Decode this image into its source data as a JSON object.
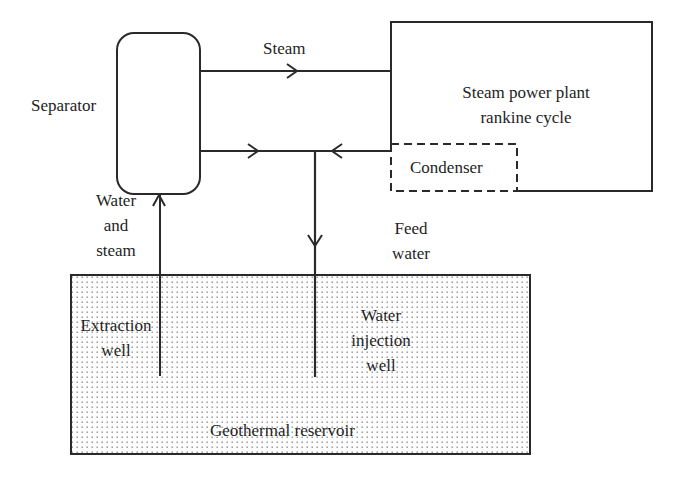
{
  "diagram": {
    "title": "",
    "colors": {
      "stroke": "#2a2a2a",
      "text": "#1e1e1e",
      "reservoir_dot": "#8a8a8a",
      "background": "#ffffff"
    },
    "nodes": {
      "separator": {
        "label": "Separator",
        "shape": "rounded-rectangle"
      },
      "power_plant": {
        "label_line1": "Steam power plant",
        "label_line2": "rankine cycle",
        "shape": "rectangle"
      },
      "condenser": {
        "label": "Condenser",
        "shape": "dashed-rectangle"
      },
      "reservoir": {
        "label": "Geothermal reservoir",
        "shape": "dotted-fill-rectangle"
      },
      "extraction_well": {
        "label_line1": "Extraction",
        "label_line2": "well"
      },
      "injection_well": {
        "label_line1": "Water",
        "label_line2": "injection",
        "label_line3": "well"
      }
    },
    "edges": {
      "steam": {
        "label": "Steam",
        "from": "Separator",
        "to": "Steam power plant rankine cycle"
      },
      "water_and_steam": {
        "label_line1": "Water",
        "label_line2": "and",
        "label_line3": "steam",
        "from": "Extraction well",
        "to": "Separator"
      },
      "feed_water": {
        "label_line1": "Feed",
        "label_line2": "water",
        "from": "Condenser",
        "to": "Water injection well"
      },
      "separator_liquid": {
        "label": "",
        "from": "Separator",
        "to": "Water injection well"
      }
    }
  }
}
